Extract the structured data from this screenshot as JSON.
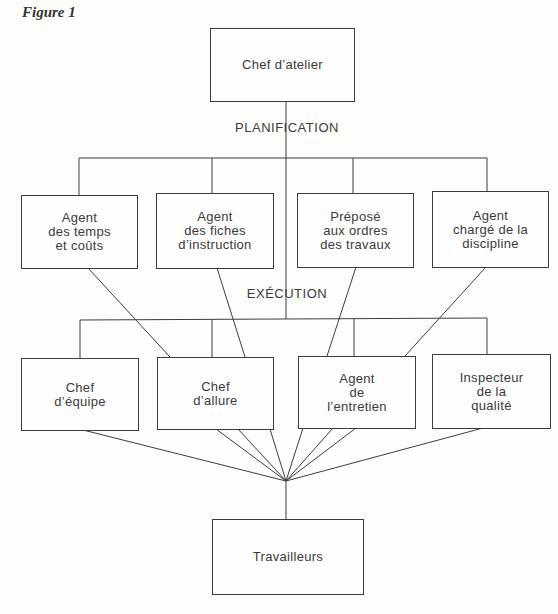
{
  "figure": {
    "label": "Figure 1"
  },
  "sections": {
    "planning": "PLANIFICATION",
    "execution": "EXÉCUTION"
  },
  "nodes": {
    "head": {
      "lines": [
        "Chef d’atelier"
      ]
    },
    "planning": [
      {
        "lines": [
          "Agent",
          "des temps",
          "et coûts"
        ]
      },
      {
        "lines": [
          "Agent",
          "des fiches",
          "d’instruction"
        ]
      },
      {
        "lines": [
          "Préposé",
          "aux ordres",
          "des travaux"
        ]
      },
      {
        "lines": [
          "Agent",
          "chargé de la",
          "discipline"
        ]
      }
    ],
    "execution": [
      {
        "lines": [
          "Chef",
          "d’équipe"
        ]
      },
      {
        "lines": [
          "Chef",
          "d’allure"
        ]
      },
      {
        "lines": [
          "Agent",
          "de",
          "l’entretien"
        ]
      },
      {
        "lines": [
          "Inspecteur",
          "de la",
          "qualité"
        ]
      }
    ],
    "workers": {
      "lines": [
        "Travailleurs"
      ]
    }
  },
  "edges": [
    [
      "Chef d’atelier",
      "Agent des temps et coûts"
    ],
    [
      "Chef d’atelier",
      "Agent des fiches d’instruction"
    ],
    [
      "Chef d’atelier",
      "Préposé aux ordres des travaux"
    ],
    [
      "Chef d’atelier",
      "Agent chargé de la discipline"
    ],
    [
      "Chef d’atelier",
      "Chef d’équipe"
    ],
    [
      "Chef d’atelier",
      "Chef d’allure"
    ],
    [
      "Chef d’atelier",
      "Agent de l’entretien"
    ],
    [
      "Chef d’atelier",
      "Inspecteur de la qualité"
    ],
    [
      "Agent des temps et coûts",
      "Chef d’allure"
    ],
    [
      "Agent des fiches d’instruction",
      "Chef d’allure"
    ],
    [
      "Préposé aux ordres des travaux",
      "Agent de l’entretien"
    ],
    [
      "Agent chargé de la discipline",
      "Agent de l’entretien"
    ],
    [
      "Chef d’équipe",
      "Travailleurs"
    ],
    [
      "Chef d’allure",
      "Travailleurs"
    ],
    [
      "Agent de l’entretien",
      "Travailleurs"
    ],
    [
      "Inspecteur de la qualité",
      "Travailleurs"
    ]
  ]
}
